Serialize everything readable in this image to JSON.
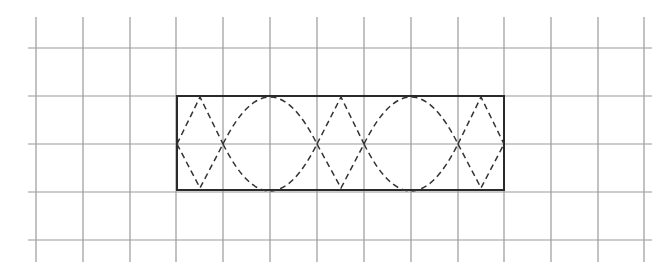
{
  "diagram": {
    "type": "grid-figure",
    "colors": {
      "grid": "#9a9a9a",
      "rectangle": "#2a2a2a",
      "dashed": "#333333",
      "background": "#ffffff"
    },
    "grid": {
      "vertical_x": [
        36,
        83,
        130,
        176,
        223,
        270,
        317,
        364,
        411,
        458,
        504,
        551,
        598,
        644
      ],
      "vertical_y_range": [
        17,
        262
      ],
      "horizontal_y": [
        48,
        96,
        144,
        192,
        240
      ],
      "horizontal_x_range": [
        28,
        652
      ]
    },
    "rectangle": {
      "x": 177,
      "y": 96,
      "width": 327,
      "height": 94,
      "cells_wide": 7,
      "cells_high": 2
    },
    "dashed_paths": [
      {
        "name": "zigzag-1-top",
        "d": "M177 144 L200 97 L223 144"
      },
      {
        "name": "zigzag-1-bottom",
        "d": "M177 144 L200 188 L223 144"
      },
      {
        "name": "arc-1-top",
        "d": "M223 144 Q270 50 317 144"
      },
      {
        "name": "arc-1-bottom",
        "d": "M223 144 Q270 238 317 144"
      },
      {
        "name": "zigzag-2-top",
        "d": "M317 144 L341 97 L364 144"
      },
      {
        "name": "zigzag-2-bottom",
        "d": "M317 144 L341 188 L364 144"
      },
      {
        "name": "arc-2-top",
        "d": "M364 144 Q411 50 458 144"
      },
      {
        "name": "arc-2-bottom",
        "d": "M364 144 Q411 238 458 144"
      },
      {
        "name": "zigzag-3-top",
        "d": "M458 144 L481 97 L504 144"
      },
      {
        "name": "zigzag-3-bottom",
        "d": "M458 144 L481 188 L504 144"
      }
    ]
  }
}
